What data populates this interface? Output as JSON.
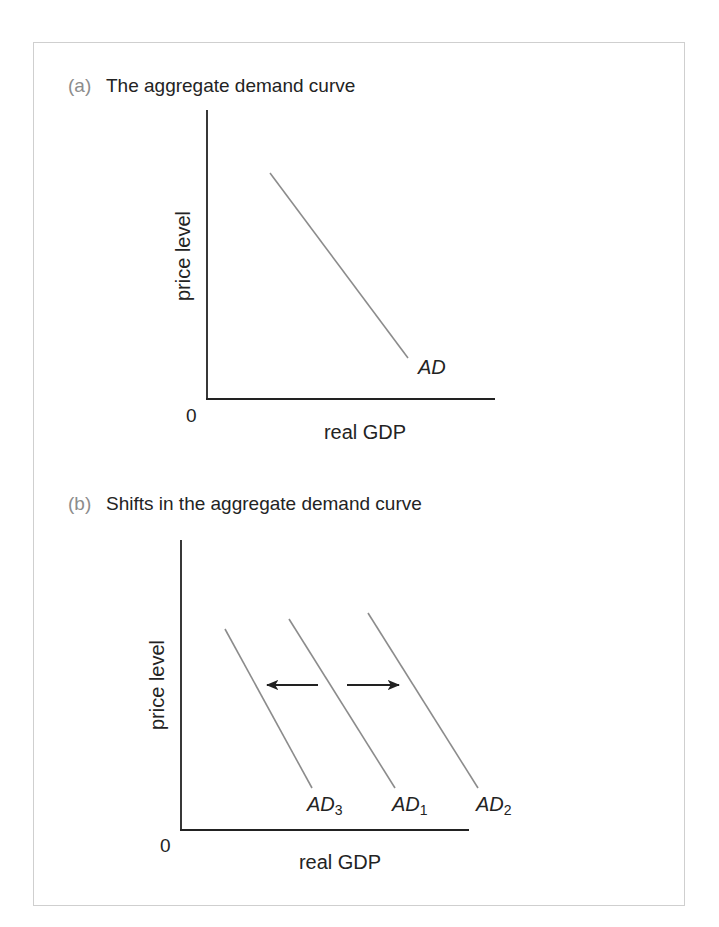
{
  "panels": [
    {
      "tag": "(a)",
      "title": "The aggregate demand curve",
      "y_axis_label": "price level",
      "x_axis_label": "real GDP",
      "origin_label": "0",
      "curves": [
        {
          "label": "AD",
          "subscript": ""
        }
      ]
    },
    {
      "tag": "(b)",
      "title": "Shifts in the aggregate demand curve",
      "y_axis_label": "price level",
      "x_axis_label": "real GDP",
      "origin_label": "0",
      "curves": [
        {
          "label": "AD",
          "subscript": "3"
        },
        {
          "label": "AD",
          "subscript": "1"
        },
        {
          "label": "AD",
          "subscript": "2"
        }
      ],
      "arrows": [
        {
          "direction": "left",
          "meaning": "decrease in aggregate demand (AD1 to AD3)"
        },
        {
          "direction": "right",
          "meaning": "increase in aggregate demand (AD1 to AD2)"
        }
      ]
    }
  ],
  "colors": {
    "axis": "#222222",
    "curve": "#8c8c8c",
    "panel_tag": "#8c8c8c",
    "text": "#232323",
    "frame_border": "#cfcfcf"
  }
}
